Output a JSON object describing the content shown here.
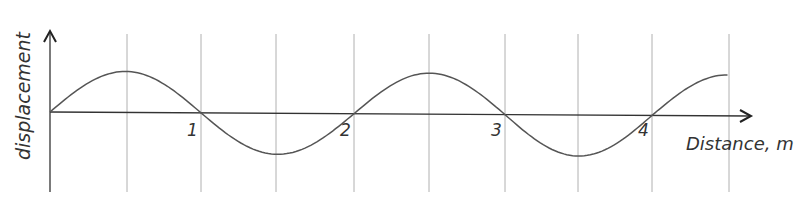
{
  "diagram": {
    "type": "wave-graph",
    "y_axis_label": "displacement",
    "x_axis_label": "Distance, m",
    "x_ticks": [
      {
        "label": "1",
        "x": 201
      },
      {
        "label": "2",
        "x": 354
      },
      {
        "label": "3",
        "x": 505
      },
      {
        "label": "4",
        "x": 652
      }
    ],
    "gridlines_x": [
      127,
      201,
      276,
      354,
      429,
      505,
      578,
      652,
      729
    ],
    "wave": {
      "start_x": 50,
      "end_x": 729,
      "wavelength_m": 2,
      "amplitude_px": 41,
      "axis_y": 113,
      "color": "#555555"
    }
  },
  "colors": {
    "grid": "#b0b0b0",
    "axis": "#333333",
    "curve": "#555555"
  }
}
